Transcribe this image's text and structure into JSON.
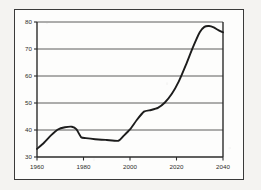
{
  "chart_data": {
    "type": "line",
    "title": "",
    "xlabel": "",
    "ylabel": "",
    "xlim": [
      1960,
      2040
    ],
    "ylim": [
      30,
      80
    ],
    "grid": true,
    "legend": false,
    "x_ticks": [
      1960,
      1980,
      2000,
      2020,
      2040
    ],
    "x_tick_labels": [
      "1960",
      "1980",
      "2000",
      "2020",
      "2040"
    ],
    "y_ticks": [
      30,
      40,
      50,
      60,
      70,
      80
    ],
    "y_tick_labels": [
      "30",
      "40",
      "50",
      "60",
      "70",
      "80"
    ],
    "gridlines_y": [
      40,
      50,
      60,
      70,
      80
    ],
    "line_color": "#1c1c1c",
    "series": [
      {
        "name": "series-1",
        "x": [
          1960,
          1963,
          1966,
          1969,
          1972,
          1975,
          1977,
          1979,
          1981,
          1985,
          1990,
          1995,
          1997,
          2000,
          2003,
          2006,
          2009,
          2012,
          2015,
          2018,
          2021,
          2024,
          2027,
          2030,
          2032,
          2034,
          2036,
          2038,
          2040
        ],
        "values": [
          33.0,
          35.3,
          38.0,
          40.2,
          41.0,
          41.2,
          40.2,
          37.3,
          37.0,
          36.6,
          36.3,
          36.0,
          37.6,
          40.2,
          43.8,
          46.8,
          47.4,
          48.2,
          50.2,
          53.4,
          58.0,
          64.0,
          70.5,
          76.2,
          78.2,
          78.5,
          78.0,
          77.0,
          76.2
        ]
      }
    ]
  },
  "figure": {
    "frame_visible": true,
    "background_color": "#fdfdfc",
    "page_color": "#f4f3f1",
    "border_color": "#3a3a3a"
  }
}
